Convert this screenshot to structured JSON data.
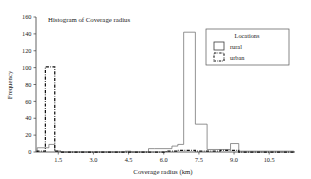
{
  "chart_data": {
    "type": "bar",
    "title": "Histogram of Coverage radius",
    "xlabel": "Coverage radius (km)",
    "ylabel": "Frequency",
    "xlim": [
      0.55,
      11.6
    ],
    "ylim": [
      0,
      160
    ],
    "grid": false,
    "legend": {
      "title": "Locations",
      "position": "top-right",
      "entries": [
        {
          "label": "rural",
          "style": "solid-outline"
        },
        {
          "label": "urban",
          "style": "dash-dot-outline"
        }
      ]
    },
    "xticks": [
      1.5,
      3.0,
      4.5,
      6.0,
      7.5,
      9.0,
      10.5
    ],
    "xtick_labels": [
      "1.5",
      "3.0",
      "4.5",
      "6.0",
      "7.5",
      "9.0",
      "10.5"
    ],
    "yticks": [
      0,
      20,
      40,
      60,
      80,
      100,
      120,
      140,
      160
    ],
    "ytick_labels": [
      "0",
      "20",
      "40",
      "60",
      "80",
      "100",
      "120",
      "140",
      "160"
    ],
    "bin_width": 0.25,
    "series": [
      {
        "name": "rural",
        "bins": [
          {
            "x0": 0.6,
            "x1": 0.85,
            "value": 5
          },
          {
            "x0": 0.85,
            "x1": 1.1,
            "value": 5
          },
          {
            "x0": 1.1,
            "x1": 1.35,
            "value": 9
          },
          {
            "x0": 1.35,
            "x1": 1.6,
            "value": 1
          },
          {
            "x0": 1.6,
            "x1": 4.35,
            "value": 0
          },
          {
            "x0": 4.35,
            "x1": 4.6,
            "value": 1
          },
          {
            "x0": 4.6,
            "x1": 5.35,
            "value": 0
          },
          {
            "x0": 5.35,
            "x1": 5.6,
            "value": 4
          },
          {
            "x0": 5.6,
            "x1": 6.35,
            "value": 4
          },
          {
            "x0": 6.35,
            "x1": 6.6,
            "value": 7
          },
          {
            "x0": 6.6,
            "x1": 6.85,
            "value": 9
          },
          {
            "x0": 6.85,
            "x1": 7.35,
            "value": 142
          },
          {
            "x0": 7.35,
            "x1": 7.85,
            "value": 33
          },
          {
            "x0": 7.85,
            "x1": 8.85,
            "value": 3
          },
          {
            "x0": 8.85,
            "x1": 9.2,
            "value": 10
          },
          {
            "x0": 9.2,
            "x1": 11.1,
            "value": 1
          },
          {
            "x0": 11.1,
            "x1": 11.55,
            "value": 1
          }
        ]
      },
      {
        "name": "urban",
        "bins": [
          {
            "x0": 0.6,
            "x1": 0.95,
            "value": 1
          },
          {
            "x0": 0.95,
            "x1": 1.35,
            "value": 101
          },
          {
            "x0": 1.35,
            "x1": 1.6,
            "value": 1
          },
          {
            "x0": 1.6,
            "x1": 6.1,
            "value": 0
          },
          {
            "x0": 6.1,
            "x1": 6.6,
            "value": 1
          },
          {
            "x0": 6.6,
            "x1": 7.35,
            "value": 2
          },
          {
            "x0": 7.35,
            "x1": 8.4,
            "value": 1
          },
          {
            "x0": 8.4,
            "x1": 9.2,
            "value": 2
          },
          {
            "x0": 9.2,
            "x1": 11.55,
            "value": 0
          }
        ]
      }
    ]
  }
}
